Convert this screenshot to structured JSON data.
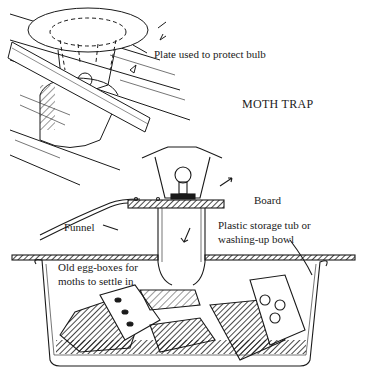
{
  "diagram": {
    "title": "MOTH TRAP",
    "labels": {
      "plate": "Plate used to protect bulb",
      "board": "Board",
      "funnel": "Funnel",
      "tub_line1": "Plastic storage tub or",
      "tub_line2": "washing-up bowl",
      "egg_line1": "Old egg-boxes for",
      "egg_line2": "moths to settle in"
    },
    "colors": {
      "ink": "#1a1a1a",
      "paper": "#ffffff"
    }
  }
}
